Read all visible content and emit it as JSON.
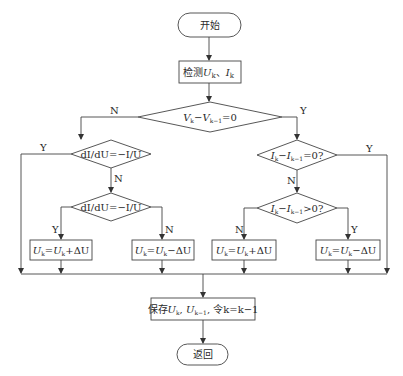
{
  "diagram": {
    "type": "flowchart",
    "nodes": {
      "start": {
        "kind": "terminal",
        "label": "开始"
      },
      "measure": {
        "kind": "process",
        "label": "检测U_k、I_k",
        "parts": [
          "检测",
          "U",
          "k",
          "、",
          "I",
          "k"
        ]
      },
      "d_main": {
        "kind": "decision",
        "label": "V_k−V_{k−1}=0"
      },
      "d_left1": {
        "kind": "decision",
        "label": "dI/dU=−I/U"
      },
      "d_left2": {
        "kind": "decision",
        "label": "dI/dU=−I/U"
      },
      "d_right1": {
        "kind": "decision",
        "label": "I_k−I_{k−1}=0?"
      },
      "d_right2": {
        "kind": "decision",
        "label": "I_k−I_{k−1}>0?"
      },
      "p1": {
        "kind": "process",
        "label": "U_k=U_k+ΔU"
      },
      "p2": {
        "kind": "process",
        "label": "U_k=U_k−ΔU"
      },
      "p3": {
        "kind": "process",
        "label": "U_k=U_k+ΔU"
      },
      "p4": {
        "kind": "process",
        "label": "U_k=U_k−ΔU"
      },
      "save": {
        "kind": "process",
        "label": "保存U_k, U_{k−1}, 令k=k−1"
      },
      "end": {
        "kind": "terminal",
        "label": "返回"
      }
    },
    "edge_labels": {
      "main_N": "N",
      "main_Y": "Y",
      "left1_Y": "Y",
      "left1_N": "N",
      "left2_Y": "Y",
      "left2_N": "N",
      "right1_Y": "Y",
      "right1_N": "N",
      "right2_N": "N",
      "right2_Y": "Y"
    },
    "edges": [
      [
        "start",
        "measure"
      ],
      [
        "measure",
        "d_main"
      ],
      [
        "d_main",
        "d_left1",
        "N"
      ],
      [
        "d_main",
        "d_right1",
        "Y"
      ],
      [
        "d_left1",
        "save",
        "Y"
      ],
      [
        "d_left1",
        "d_left2",
        "N"
      ],
      [
        "d_left2",
        "p1",
        "Y"
      ],
      [
        "d_left2",
        "p2",
        "N"
      ],
      [
        "d_right1",
        "save",
        "Y"
      ],
      [
        "d_right1",
        "d_right2",
        "N"
      ],
      [
        "d_right2",
        "p3",
        "N"
      ],
      [
        "d_right2",
        "p4",
        "Y"
      ],
      [
        "p1",
        "save"
      ],
      [
        "p2",
        "save"
      ],
      [
        "p3",
        "save"
      ],
      [
        "p4",
        "save"
      ],
      [
        "save",
        "end"
      ]
    ]
  },
  "text": {
    "start": "开始",
    "measure_prefix": "检测",
    "U": "U",
    "I": "I",
    "k": "k",
    "k1": "k−1",
    "sep": "、",
    "dIdU": "dI/dU=−I/U",
    "minus": "−",
    "eq0": "=0",
    "eq0q": "=0?",
    "gt0q": ">0?",
    "plus_dU": "+ΔU",
    "minus_dU": "−ΔU",
    "eq": "=",
    "save_prefix": "保存",
    "comma": ", ",
    "save_suffix": "令k=k−1",
    "end": "返回",
    "N": "N",
    "Y": "Y"
  }
}
